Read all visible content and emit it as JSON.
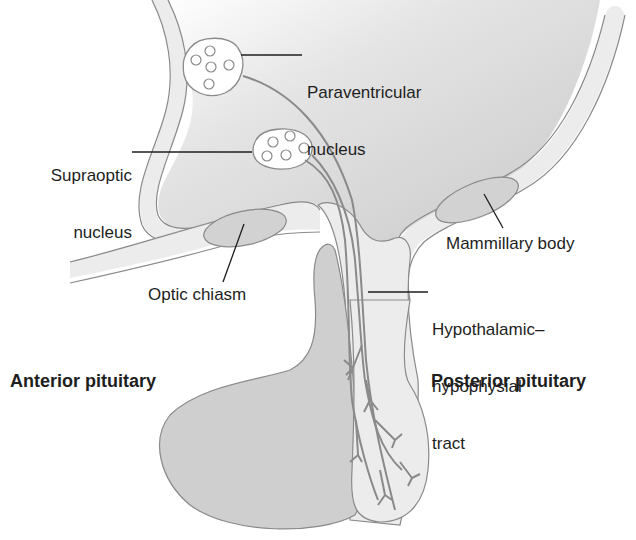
{
  "diagram": {
    "colors": {
      "background": "#ffffff",
      "tissue_dark": "#cfcfcf",
      "tissue_light": "#ececec",
      "outline": "#8a8a8a",
      "leader_line": "#1e1e1e",
      "text": "#1e1e1e"
    },
    "labels": {
      "paraventricular_line1": "Paraventricular",
      "paraventricular_line2": "nucleus",
      "supraoptic_line1": "Supraoptic",
      "supraoptic_line2": "nucleus",
      "mammillary": "Mammillary body",
      "optic_chiasm": "Optic chiasm",
      "tract_line1": "Hypothalamic–",
      "tract_line2": "hypophysial",
      "tract_line3": "tract",
      "anterior": "Anterior pituitary",
      "posterior": "Posterior pituitary"
    }
  }
}
